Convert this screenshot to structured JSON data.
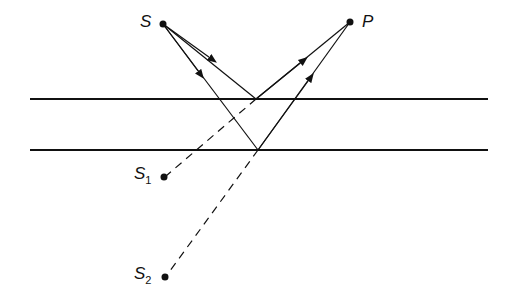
{
  "diagram": {
    "labels": {
      "S": "S",
      "P": "P",
      "S1": "S",
      "S1_sub": "1",
      "S2": "S",
      "S2_sub": "2"
    },
    "colors": {
      "line": "#111111",
      "background": "#ffffff"
    }
  }
}
